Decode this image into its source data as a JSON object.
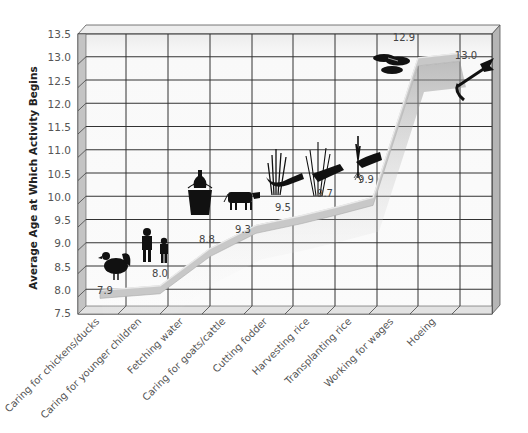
{
  "chart_data": {
    "type": "line",
    "title": "",
    "xlabel": "",
    "ylabel": "Average Age at Which Activity Begins",
    "ylim": [
      7.5,
      13.5
    ],
    "yticks": [
      "7.5",
      "8.0",
      "8.5",
      "9.0",
      "9.5",
      "10.0",
      "10.5",
      "11.0",
      "11.5",
      "12.0",
      "12.5",
      "13.0",
      "13.5"
    ],
    "grid": true,
    "legend": null,
    "categories": [
      "Caring for chickens/ducks",
      "Caring for younger children",
      "Fetching water",
      "Caring for goats/cattle",
      "Cutting fodder",
      "Harvesting rice",
      "Transplanting rice",
      "Working for wages",
      "Hoeing"
    ],
    "values": [
      7.9,
      8.0,
      8.8,
      9.3,
      9.5,
      9.7,
      9.9,
      12.9,
      13.0
    ],
    "value_labels": [
      "7.9",
      "8.0",
      "8.8",
      "9.3",
      "9.5",
      "9.7",
      "9.9",
      "12.9",
      "13.0"
    ],
    "icons": [
      "rooster-icon",
      "children-icon",
      "water-bucket-icon",
      "cow-icon",
      "fodder-sickle-icon",
      "rice-sheaf-icon",
      "rice-seedling-icon",
      "coins-icon",
      "hoe-icon"
    ],
    "style": "3d-ribbon"
  },
  "colors": {
    "ribbon": "#c8c8c8",
    "ribbon_shadow": "#9a9a9a",
    "grid": "#333333",
    "frame_side": "#b8b8b8",
    "frame_top": "#e6e6e6",
    "plot_bg": "#f7f7f7",
    "icon": "#111111"
  }
}
